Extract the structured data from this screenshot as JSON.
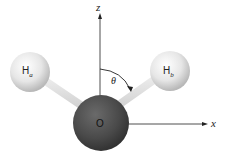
{
  "diagram": {
    "title": "",
    "axes": {
      "z_label": "z",
      "x_label": "x"
    },
    "angle_label": "θ",
    "atoms": [
      {
        "id": "Ha",
        "symbol": "H",
        "subscript": "a"
      },
      {
        "id": "Hb",
        "symbol": "H",
        "subscript": "b"
      },
      {
        "id": "O",
        "symbol": "O"
      }
    ],
    "colors": {
      "hydrogen": "#e8e8e8",
      "oxygen": "#4a4a4a",
      "bond": "#dcdcdc",
      "axis": "#222222"
    }
  }
}
